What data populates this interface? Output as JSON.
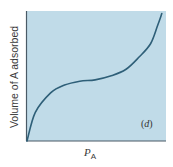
{
  "chart_data": {
    "type": "line",
    "title": "",
    "xlabel": "P_A",
    "xlabel_main": "P",
    "xlabel_sub": "A",
    "ylabel": "Volume of A adsorbed",
    "annotation": "(d)",
    "annotation_letter": "d",
    "grid": false,
    "ticks": "none",
    "legend": null,
    "series": [
      {
        "name": "isotherm",
        "color": "#2e5f78",
        "x": [
          0.0,
          0.06,
          0.17,
          0.27,
          0.38,
          0.49,
          0.6,
          0.71,
          0.81,
          0.89,
          0.94,
          0.97
        ],
        "y": [
          0.0,
          0.22,
          0.37,
          0.43,
          0.46,
          0.47,
          0.5,
          0.55,
          0.65,
          0.75,
          0.89,
          0.98
        ]
      }
    ],
    "xlim": [
      0,
      1
    ],
    "ylim": [
      0,
      1
    ]
  },
  "colors": {
    "plot_background": "#c0dbe8",
    "axis": "#4a5a66",
    "curve": "#2e5f78"
  }
}
